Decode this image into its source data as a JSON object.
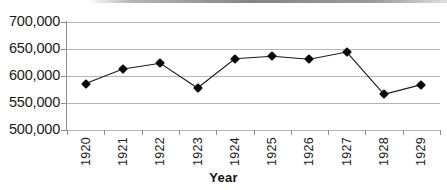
{
  "chart_data": {
    "type": "line",
    "title": "",
    "xlabel": "Year",
    "ylabel": "",
    "categories": [
      "1920",
      "1921",
      "1922",
      "1923",
      "1924",
      "1925",
      "1926",
      "1927",
      "1928",
      "1929"
    ],
    "values": [
      586000,
      613000,
      623500,
      577800,
      632000,
      636500,
      630900,
      644400,
      566000,
      584000
    ],
    "series": [
      {
        "name": "",
        "values": [
          586000,
          613000,
          623500,
          577800,
          632000,
          636500,
          630900,
          644400,
          566000,
          584000
        ]
      }
    ],
    "ylim": [
      500000,
      700000
    ],
    "yticks": [
      500000,
      550000,
      600000,
      650000,
      700000
    ],
    "ytick_labels": [
      "500,000",
      "550,000",
      "600,000",
      "650,000",
      "700,000"
    ],
    "grid": true,
    "legend": "none",
    "marker": "diamond",
    "line_color": "#1a1a1a",
    "marker_color": "#0a0a0a",
    "grid_color": "#b7b7b7",
    "axis_color": "#8d8d8d"
  },
  "axis": {
    "x_title": "Year"
  }
}
